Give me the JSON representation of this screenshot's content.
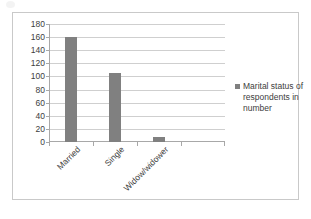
{
  "chart_data": {
    "type": "bar",
    "title": "",
    "xlabel": "",
    "ylabel": "",
    "categories": [
      "Married",
      "Single",
      "Widow/widower",
      ""
    ],
    "values": [
      160,
      105,
      7,
      null
    ],
    "series": [
      {
        "name": "Marital status of respondents in number",
        "values": [
          160,
          105,
          7,
          null
        ]
      }
    ],
    "ylim": [
      0,
      180
    ],
    "ytick_step": 20,
    "yticks": [
      "180",
      "160",
      "140",
      "120",
      "100",
      "80",
      "60",
      "40",
      "20",
      "0"
    ],
    "grid": true,
    "legend_position": "right",
    "bar_color": "#808080",
    "gridline_color": "#cfcfcf",
    "axis_color": "#a8a8a8",
    "frame_color": "#c9c9c9",
    "text_color": "#3d3d3d"
  },
  "legend": {
    "entries": [
      {
        "label": "Marital status of respondents in number",
        "color": "#808080"
      }
    ]
  }
}
